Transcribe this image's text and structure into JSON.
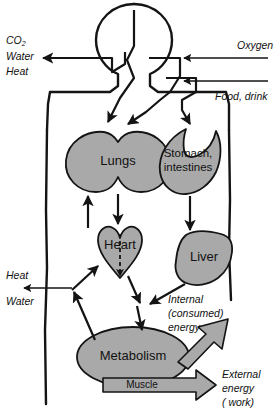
{
  "diagram": {
    "colors": {
      "organ_fill": "#a9a9a9",
      "outline": "#141414",
      "background": "#ffffff",
      "block_arrow_fill": "#a9a9a9"
    },
    "organs": [
      {
        "id": "lungs",
        "label": "Lungs",
        "shape": "twin-lobe"
      },
      {
        "id": "stomach-intestines",
        "label_line1": "Stomach,",
        "label_line2": "intestines",
        "shape": "crescent"
      },
      {
        "id": "heart",
        "label": "Heart",
        "shape": "heart"
      },
      {
        "id": "liver",
        "label": "Liver",
        "shape": "blob"
      },
      {
        "id": "metabolism",
        "label": "Metabolism",
        "shape": "ellipse"
      }
    ],
    "inputs": [
      {
        "id": "oxygen",
        "label": "Oxygen"
      },
      {
        "id": "food-drink",
        "label": "Food, drink"
      }
    ],
    "outputs_top_left": {
      "line1": "CO",
      "subscript": "2",
      "line2": "Water",
      "line3": "Heat"
    },
    "outputs_mid_left": {
      "line1": "Heat",
      "line2": "Water"
    },
    "energy_internal": {
      "line1": "Internal",
      "line2": "(consumed)",
      "line3": "energy"
    },
    "energy_external": {
      "line1": "External",
      "line2": "energy",
      "line3": "( work)"
    },
    "muscle": {
      "label": "Muscle"
    }
  }
}
